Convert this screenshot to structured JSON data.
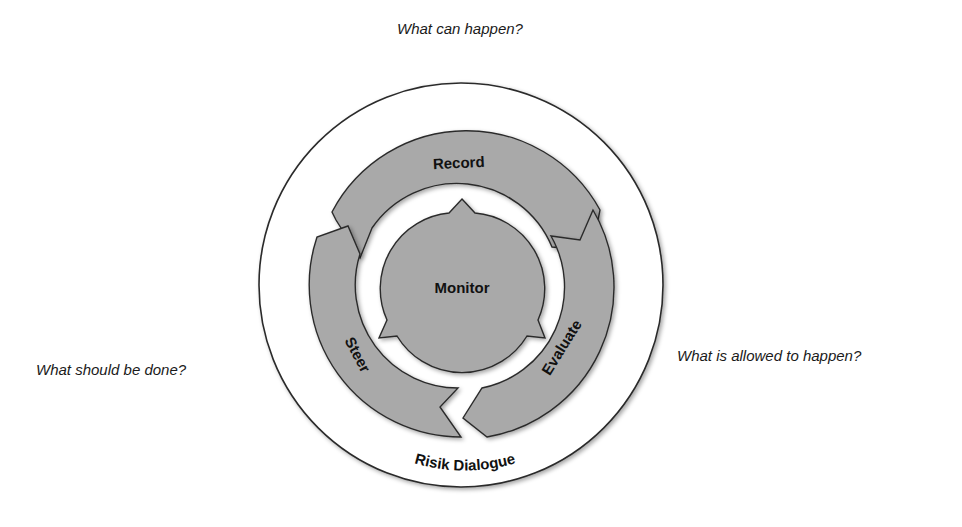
{
  "questions": {
    "top": "What can happen?",
    "left": "What should be done?",
    "right": "What is allowed to happen?"
  },
  "cycle": {
    "center": "Monitor",
    "steps": [
      "Record",
      "Evaluate",
      "Steer"
    ],
    "outer_ring_label": "Risik Dialogue"
  },
  "colors": {
    "arrow_fill": "#a9a9a9",
    "outline": "#2b2b2b",
    "background": "#ffffff"
  }
}
